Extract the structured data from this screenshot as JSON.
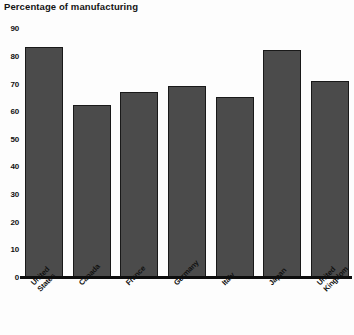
{
  "chart_data": {
    "type": "bar",
    "title": "Percentage of manufacturing",
    "xlabel": "",
    "ylabel": "",
    "ylim": [
      0,
      90
    ],
    "grid": false,
    "legend": null,
    "yticks": [
      90,
      80,
      70,
      60,
      50,
      40,
      30,
      20,
      10,
      0
    ],
    "categories": [
      "United States",
      "Canada",
      "France",
      "Germany",
      "Italy",
      "Japan",
      "United Kingdom"
    ],
    "category_lines": [
      [
        "United",
        "States"
      ],
      [
        "Canada"
      ],
      [
        "France"
      ],
      [
        "Germany"
      ],
      [
        "Italy"
      ],
      [
        "Japan"
      ],
      [
        "United",
        "Kingdom"
      ]
    ],
    "values": [
      83,
      62,
      67,
      69,
      65,
      82,
      71
    ],
    "colors": {
      "bar_fill": "#4b4b4b",
      "bar_edge": "#191919",
      "axis": "#0d0d0d",
      "text": "#111111",
      "background": "#fdfdfd"
    }
  }
}
